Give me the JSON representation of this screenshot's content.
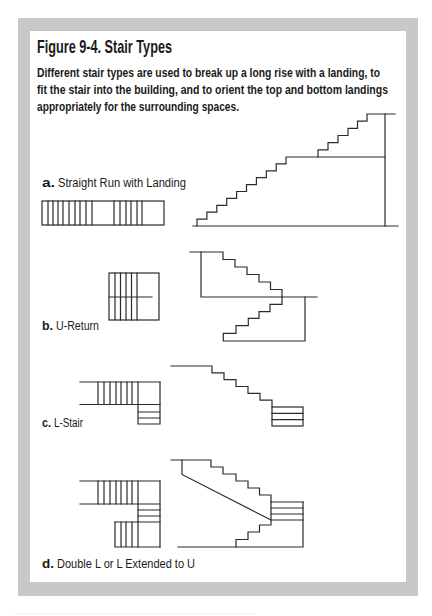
{
  "figure": {
    "title": "Figure 9-4. Stair Types",
    "caption_lines": [
      "Different stair types are used to break up a long rise with a landing, to",
      "fit the stair into the building, and to orient the top and bottom landings",
      "appropriately for the surrounding spaces."
    ],
    "frame_color": "#c8c8c8",
    "line_color": "#2b2b2b"
  },
  "diagrams": [
    {
      "letter": "a.",
      "name": "Straight Run with Landing",
      "views": [
        "plan",
        "section"
      ],
      "section_risers": {
        "lower_flight": 10,
        "upper_flight": 6
      }
    },
    {
      "letter": "b.",
      "name": "U-Return",
      "views": [
        "plan",
        "section"
      ],
      "section_risers": {
        "upper_flight": 6,
        "lower_flight": 6
      }
    },
    {
      "letter": "c.",
      "name": "L-Stair",
      "views": [
        "plan",
        "section"
      ],
      "section_risers": {
        "first_flight": 6,
        "turned_flight_treads": 3
      }
    },
    {
      "letter": "d.",
      "name": "Double L or L Extended to U",
      "views": [
        "plan",
        "section"
      ],
      "section_risers": {
        "upper_flight": 6,
        "middle_flight_treads": 3,
        "lower_flight": 4
      }
    }
  ]
}
